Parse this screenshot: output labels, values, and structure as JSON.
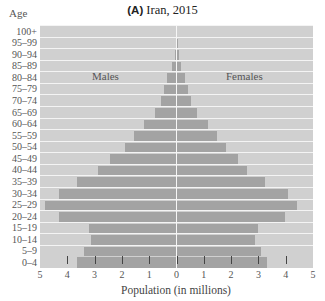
{
  "chart_data": {
    "type": "bar",
    "subtype": "population-pyramid",
    "title_tag": "(A)",
    "title": "Iran, 2015",
    "ylabel": "Age",
    "xlabel": "Population (in millions)",
    "xlim": [
      -5,
      5
    ],
    "x_ticks": [
      5,
      4,
      3,
      2,
      1,
      0,
      1,
      2,
      3,
      4,
      5
    ],
    "grid": true,
    "annotations": [
      "Males",
      "Females"
    ],
    "categories": [
      "100+",
      "95–99",
      "90–94",
      "85–89",
      "80–84",
      "75–79",
      "70–74",
      "65–69",
      "60–64",
      "55–59",
      "50–54",
      "45–49",
      "40–44",
      "35–39",
      "30–34",
      "25–29",
      "20–24",
      "15–19",
      "10–14",
      "5–9",
      "0–4"
    ],
    "series": [
      {
        "name": "Males",
        "side": "left",
        "values": [
          0.0,
          0.02,
          0.07,
          0.18,
          0.33,
          0.44,
          0.55,
          0.77,
          1.2,
          1.57,
          1.87,
          2.42,
          2.86,
          3.63,
          4.32,
          4.8,
          4.29,
          3.22,
          3.15,
          3.4,
          3.63
        ]
      },
      {
        "name": "Females",
        "side": "right",
        "values": [
          0.0,
          0.03,
          0.08,
          0.17,
          0.3,
          0.41,
          0.52,
          0.74,
          1.14,
          1.5,
          1.83,
          2.27,
          2.6,
          3.26,
          4.07,
          4.4,
          3.96,
          2.97,
          2.89,
          3.08,
          3.33
        ]
      }
    ],
    "colors": {
      "bar": "#a3a3a3",
      "background": "#d0d0d0",
      "gridline": "#f4f4f4"
    }
  }
}
